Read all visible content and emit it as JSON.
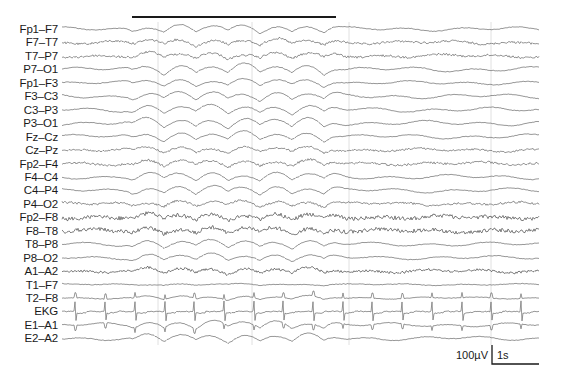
{
  "chart_data": {
    "type": "line",
    "title": "",
    "channels": [
      "Fp1–F7",
      "F7–T7",
      "T7–P7",
      "P7–O1",
      "Fp1–F3",
      "F3–C3",
      "C3–P3",
      "P3–O1",
      "Fz–Cz",
      "Cz–Pz",
      "Fp2–F4",
      "F4–C4",
      "C4–P4",
      "P4–O2",
      "Fp2–F8",
      "F8–T8",
      "T8–P8",
      "P8–O2",
      "A1–A2",
      "T1–F7",
      "T2–F8",
      "EKG",
      "E1–A1",
      "E2–A2"
    ],
    "highlight_bar": {
      "x_start_px": 132,
      "x_end_px": 336,
      "y_px": 17,
      "meaning": "event segment (rhythmic slow activity)"
    },
    "time_gridlines_px": [
      158,
      252,
      349,
      491
    ],
    "ekg_interval_px": 29.7,
    "scale_bar": {
      "amplitude_label": "100µV",
      "time_label": "1s"
    },
    "grid": true,
    "legend": null
  },
  "scale": {
    "amplitude": "100µV",
    "time": "1s"
  },
  "colors": {
    "trace": "#6a6a6a",
    "trace_dark": "#4a4a4a",
    "bar": "#1a1a1a",
    "gridline": "#d8d8d8",
    "text": "#1a1a1a"
  }
}
